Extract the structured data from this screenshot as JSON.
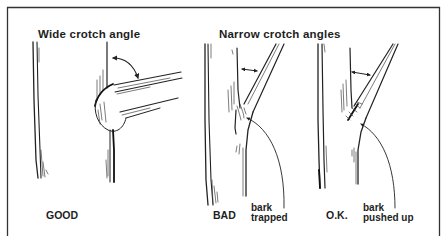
{
  "diagram": {
    "panels": [
      {
        "heading": "Wide crotch angle",
        "examples": [
          {
            "caption": "GOOD",
            "note": []
          }
        ]
      },
      {
        "heading": "Narrow crotch angles",
        "examples": [
          {
            "caption": "BAD",
            "note": [
              "bark",
              "trapped"
            ]
          },
          {
            "caption": "O.K.",
            "note": [
              "bark",
              "pushed up"
            ]
          }
        ]
      }
    ],
    "icons": {
      "angle_arrow": "double-headed-arrow-icon",
      "pointer_arrow": "pointer-arrow-icon"
    }
  }
}
